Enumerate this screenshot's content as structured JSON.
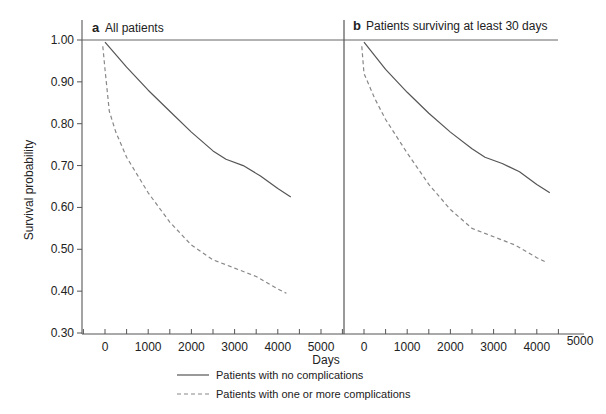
{
  "chart_data": [
    {
      "type": "line",
      "panel_letter": "a",
      "title": "All patients",
      "xlabel": "Days",
      "ylabel": "Survival probability",
      "xlim": [
        -500,
        5500
      ],
      "ylim": [
        0.3,
        1.0
      ],
      "xticks": [
        0,
        1000,
        2000,
        3000,
        4000,
        5000
      ],
      "yticks": [
        1.0,
        0.9,
        0.8,
        0.7,
        0.6,
        0.5,
        0.4,
        0.3
      ],
      "ytick_labels": [
        "1.00",
        "0.90",
        "0.80",
        "0.70",
        "0.60",
        "0.50",
        "0.40",
        "0.30"
      ],
      "grid": false,
      "series": [
        {
          "name": "Patients with no complications",
          "style": "solid",
          "x": [
            0,
            500,
            1000,
            1500,
            2000,
            2500,
            2800,
            3200,
            3600,
            4000,
            4300
          ],
          "y": [
            0.995,
            0.935,
            0.88,
            0.83,
            0.78,
            0.735,
            0.715,
            0.7,
            0.675,
            0.645,
            0.625
          ]
        },
        {
          "name": "Patients with one or more complications",
          "style": "dashed",
          "x": [
            -50,
            0,
            100,
            250,
            500,
            1000,
            1500,
            2000,
            2500,
            3000,
            3500,
            4000,
            4200
          ],
          "y": [
            0.985,
            0.93,
            0.83,
            0.78,
            0.72,
            0.635,
            0.565,
            0.51,
            0.475,
            0.455,
            0.435,
            0.405,
            0.395
          ]
        }
      ]
    },
    {
      "type": "line",
      "panel_letter": "b",
      "title": "Patients surviving at least 30 days",
      "xlabel": "Days",
      "ylabel": "Survival probability",
      "xlim": [
        -500,
        5500
      ],
      "ylim": [
        0.3,
        1.0
      ],
      "xticks": [
        0,
        1000,
        2000,
        3000,
        4000,
        5000
      ],
      "yticks": [
        1.0,
        0.9,
        0.8,
        0.7,
        0.6,
        0.5,
        0.4,
        0.3
      ],
      "grid": false,
      "series": [
        {
          "name": "Patients with no complications",
          "style": "solid",
          "x": [
            0,
            500,
            1000,
            1500,
            2000,
            2500,
            2800,
            3200,
            3600,
            4000,
            4300
          ],
          "y": [
            0.995,
            0.93,
            0.875,
            0.825,
            0.78,
            0.74,
            0.72,
            0.705,
            0.685,
            0.655,
            0.635
          ]
        },
        {
          "name": "Patients with one or more complications",
          "style": "dashed",
          "x": [
            -50,
            0,
            250,
            500,
            1000,
            1500,
            2000,
            2500,
            3000,
            3500,
            4000,
            4200
          ],
          "y": [
            0.985,
            0.92,
            0.86,
            0.81,
            0.73,
            0.655,
            0.595,
            0.55,
            0.53,
            0.51,
            0.48,
            0.47
          ]
        }
      ]
    }
  ],
  "legend": {
    "items": [
      {
        "label": "Patients with no complications",
        "style": "solid"
      },
      {
        "label": "Patients with one or more complications",
        "style": "dashed"
      }
    ]
  },
  "colors": {
    "axis": "#555555",
    "solid_line": "#555555",
    "dashed_line": "#888888",
    "text": "#222222"
  }
}
